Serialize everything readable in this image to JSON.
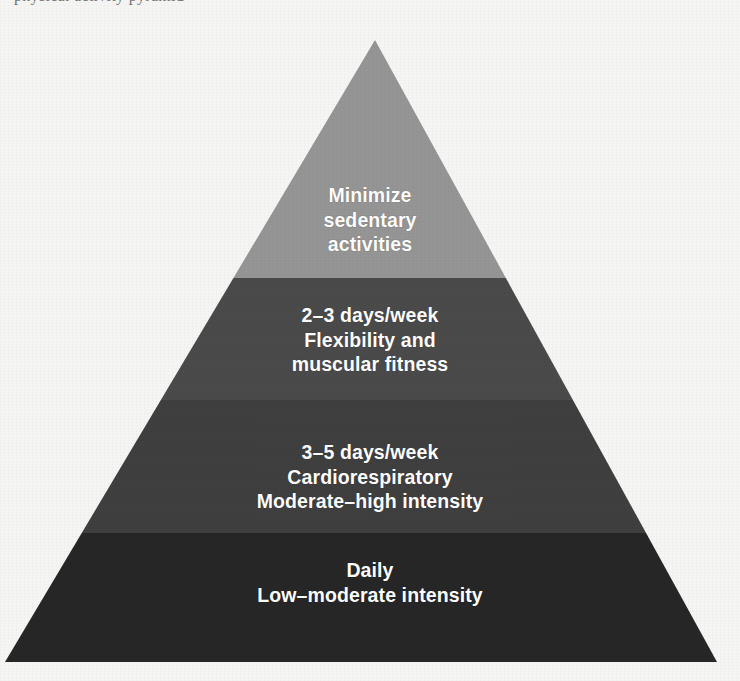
{
  "page": {
    "background_color": "#f5f5f4",
    "cropped_header_fragment": "physical activity pyramid"
  },
  "figure": {
    "type": "pyramid-diagram",
    "name": "physical-activity-pyramid",
    "apex": {
      "x": 375,
      "y": 40
    },
    "base_left": {
      "x": 5,
      "y": 662
    },
    "base_right": {
      "x": 717,
      "y": 662
    },
    "tier_boundaries_y": [
      278,
      400,
      533
    ],
    "tiers": [
      {
        "index": 1,
        "position": "top",
        "color": "#959595",
        "text": "Minimize\nsedentary\nactivities",
        "lines": [
          "Minimize",
          "sedentary",
          "activities"
        ]
      },
      {
        "index": 2,
        "position": "upper-middle",
        "color": "#4a4a4a",
        "text": "2–3 days/week\nFlexibility and\nmuscular fitness",
        "lines": [
          "2–3 days/week",
          "Flexibility and",
          "muscular fitness"
        ]
      },
      {
        "index": 3,
        "position": "lower-middle",
        "color": "#3f3f3f",
        "text": "3–5 days/week\nCardiorespiratory\nModerate–high intensity",
        "lines": [
          "3–5 days/week",
          "Cardiorespiratory",
          "Moderate–high intensity"
        ]
      },
      {
        "index": 4,
        "position": "base",
        "color": "#262626",
        "text": "Daily\nLow–moderate intensity",
        "lines": [
          "Daily",
          "Low–moderate intensity"
        ]
      }
    ],
    "label_color": "#ffffff"
  }
}
